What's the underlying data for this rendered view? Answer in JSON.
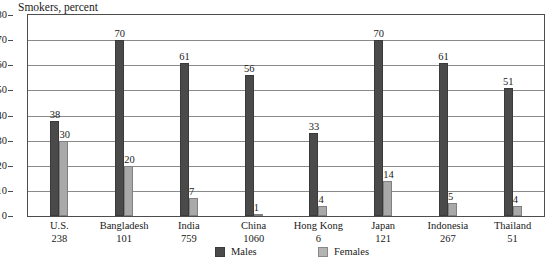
{
  "chart_data": {
    "type": "bar",
    "title": "Smokers, percent",
    "xlabel": "",
    "ylabel": "",
    "ylim": [
      0,
      80
    ],
    "yticks": [
      0,
      10,
      20,
      30,
      40,
      50,
      60,
      70,
      80
    ],
    "grid": true,
    "legend_position": "bottom-center",
    "categories": [
      "U.S.",
      "Bangladesh",
      "India",
      "China",
      "Hong Kong",
      "Japan",
      "Indonesia",
      "Thailand"
    ],
    "category_sublabels": [
      "238",
      "101",
      "759",
      "1060",
      "6",
      "121",
      "267",
      "51"
    ],
    "series": [
      {
        "name": "Males",
        "color": "#4a4a4a",
        "values": [
          38,
          70,
          61,
          56,
          33,
          70,
          61,
          51
        ]
      },
      {
        "name": "Females",
        "color": "#a9a9a9",
        "values": [
          30,
          20,
          7,
          1,
          4,
          14,
          5,
          4
        ]
      }
    ]
  },
  "legend": {
    "items": [
      {
        "label": "Males",
        "swatch": "male-swatch"
      },
      {
        "label": "Females",
        "swatch": "female-swatch"
      }
    ]
  }
}
